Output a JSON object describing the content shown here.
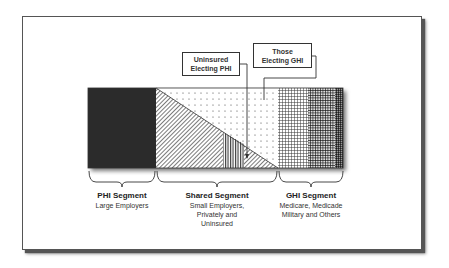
{
  "diagram": {
    "callouts": [
      {
        "id": "uninsured-electing-phi",
        "line1": "Uninsured",
        "line2": "Electing PHI"
      },
      {
        "id": "those-electing-ghi",
        "line1": "Those",
        "line2": "Electing GHI"
      }
    ],
    "segments": [
      {
        "title": "PHI Segment",
        "lines": [
          "Large Employers"
        ]
      },
      {
        "title": "Shared Segment",
        "lines": [
          "Small Employers,",
          "Privately and",
          "Uninsured"
        ]
      },
      {
        "title": "GHI Segment",
        "lines": [
          "Medicare, Medicade",
          "Military and Others"
        ]
      }
    ],
    "colors": {
      "phi_fill": "#2b2b2b",
      "outline": "#333333",
      "shadow": "#555555"
    }
  }
}
